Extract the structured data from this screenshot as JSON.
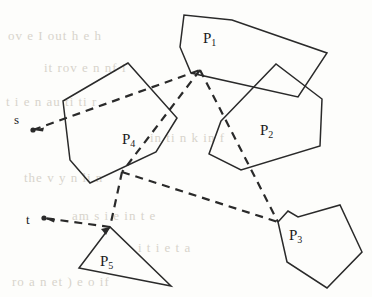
{
  "figure": {
    "width": 372,
    "height": 297,
    "background_color": "#fdfdfb",
    "ink_color": "#2a2a2a",
    "bleed_color": "#d8d4cc"
  },
  "terminals": [
    {
      "id": "s",
      "label": "s",
      "label_x": 14,
      "label_y": 113,
      "point_x": 33,
      "point_y": 130
    },
    {
      "id": "t",
      "label": "t",
      "label_x": 26,
      "label_y": 213,
      "point_x": 44,
      "point_y": 218
    }
  ],
  "obstacles": [
    {
      "id": "P1",
      "label": "P",
      "subscript": "1",
      "label_x": 203,
      "label_y": 31,
      "vertices": "180,47 184,15 232,20 327,53 298,97 191,73"
    },
    {
      "id": "P2",
      "label": "P",
      "subscript": "2",
      "label_x": 260,
      "label_y": 123,
      "vertices": "221,121 276,64 322,99 320,146 241,170 209,154"
    },
    {
      "id": "P3",
      "label": "P",
      "subscript": "3",
      "label_x": 289,
      "label_y": 228,
      "vertices": "278,222 288,211 298,217 340,205 362,252 327,288 287,262"
    },
    {
      "id": "P4",
      "label": "P",
      "subscript": "4",
      "label_x": 122,
      "label_y": 132,
      "vertices": "128,63 63,101 70,160 90,183 156,152 177,118"
    },
    {
      "id": "P5",
      "label": "P",
      "subscript": "5",
      "label_x": 100,
      "label_y": 254,
      "vertices": "110,227 79,268 171,286"
    }
  ],
  "path": {
    "name": "shortest-path",
    "style": "dashed",
    "dash_pattern": "8,6",
    "stroke_width": 2.2,
    "segments": [
      {
        "from": "s",
        "to": "v1",
        "points": "33,130 200,70"
      },
      {
        "from": "v1",
        "to": "P3-corner",
        "points": "200,70 278,222"
      },
      {
        "from": "v1",
        "to": "v2",
        "points": "200,70 122,172"
      },
      {
        "from": "v2",
        "to": "P3-corner",
        "points": "122,172 278,222"
      },
      {
        "from": "v2",
        "to": "apex",
        "points": "122,172 110,227"
      },
      {
        "from": "apex",
        "to": "t",
        "points": "110,227 44,218"
      }
    ],
    "nodes": [
      {
        "id": "v1",
        "x": 200,
        "y": 70
      },
      {
        "id": "v2",
        "x": 122,
        "y": 172
      },
      {
        "id": "apex",
        "x": 110,
        "y": 227
      },
      {
        "id": "P3-corner",
        "x": 278,
        "y": 222
      }
    ]
  },
  "bleed_text": [
    {
      "text": "ov  e     I out  h  e h",
      "x": 8,
      "y": 28,
      "size": 13
    },
    {
      "text": "it     rov  e    n  nf   i",
      "x": 44,
      "y": 60,
      "size": 13
    },
    {
      "text": "t  i     e   n     au  ti  ti r",
      "x": 6,
      "y": 94,
      "size": 13
    },
    {
      "text": "in   ti      n  k  in f",
      "x": 150,
      "y": 130,
      "size": 13
    },
    {
      "text": "the   v  y  n   li   n",
      "x": 24,
      "y": 170,
      "size": 13
    },
    {
      "text": "am  s     i  e  in t   e",
      "x": 72,
      "y": 208,
      "size": 13
    },
    {
      "text": "i        t     i e  t       a",
      "x": 138,
      "y": 240,
      "size": 13
    },
    {
      "text": "ro a         n  et )  e  o        if",
      "x": 12,
      "y": 274,
      "size": 13
    }
  ]
}
